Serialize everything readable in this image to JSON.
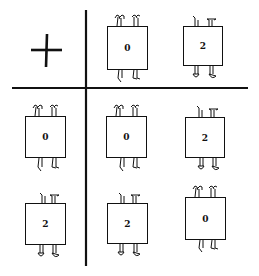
{
  "table": {
    "operator": "+",
    "column_headers": [
      "0",
      "2"
    ],
    "row_headers": [
      "0",
      "2"
    ],
    "cells": [
      [
        "0",
        "2"
      ],
      [
        "2",
        "0"
      ]
    ]
  },
  "figures": {
    "col_0": {
      "label": "0",
      "pose": "arms-up"
    },
    "col_2": {
      "label": "2",
      "pose": "upside-down"
    },
    "row_0": {
      "label": "0",
      "pose": "arms-up"
    },
    "row_2": {
      "label": "2",
      "pose": "upside-down"
    },
    "cell_0_0": {
      "label": "0",
      "pose": "arms-up"
    },
    "cell_0_2": {
      "label": "2",
      "pose": "upside-down"
    },
    "cell_2_0": {
      "label": "2",
      "pose": "upside-down"
    },
    "cell_2_2": {
      "label": "0",
      "pose": "arms-up"
    }
  },
  "colors": {
    "ink": "#111111",
    "background": "#ffffff"
  }
}
